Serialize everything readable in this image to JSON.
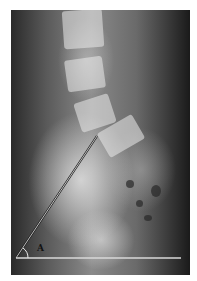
{
  "image": {
    "subject": "lateral lumbosacral spine radiograph",
    "background_color": "#ffffff"
  },
  "annotation": {
    "angle_label": "A",
    "line_color": "#e8e8e8",
    "oblique_line": {
      "x1": 16,
      "y1": 258,
      "x2": 97,
      "y2": 136
    },
    "horizontal_line": {
      "x1": 16,
      "y1": 258,
      "x2": 181,
      "y2": 258
    }
  }
}
